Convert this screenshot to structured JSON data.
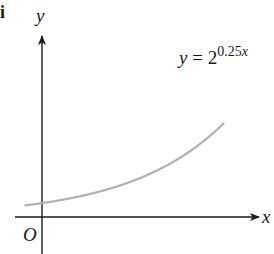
{
  "part_label": "i",
  "axes": {
    "x_label": "x",
    "y_label": "y",
    "origin_label": "O"
  },
  "curve": {
    "equation_lhs": "y",
    "equation_eq": " = ",
    "equation_base": "2",
    "equation_exponent": "0.25x",
    "function": "2^(0.25x)",
    "color": "#b0b0b0"
  },
  "chart_data": {
    "type": "line",
    "title": "",
    "xlabel": "x",
    "ylabel": "y",
    "series": [
      {
        "name": "y = 2^{0.25x}",
        "x": [
          -1,
          0,
          1,
          2,
          3,
          4,
          5,
          6,
          7,
          8,
          9,
          10,
          11
        ],
        "values": [
          0.84,
          1,
          1.19,
          1.41,
          1.68,
          2,
          2.38,
          2.83,
          3.36,
          4,
          4.76,
          5.66,
          6.73
        ]
      }
    ],
    "xlim": [
      -1.5,
      13
    ],
    "ylim": [
      -2,
      10
    ],
    "grid": false,
    "legend": "none",
    "annotations": [
      "y = 2^{0.25x}",
      "O"
    ]
  }
}
